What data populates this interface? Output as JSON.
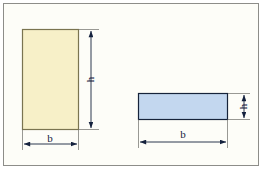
{
  "figure": {
    "background_color": "#fdfdf8",
    "frame_color": "#8d8d89",
    "annotation_color": "#14213d"
  },
  "shapes": [
    {
      "id": "tall-rectangle",
      "name": "tall-rectangle",
      "fill_color": "#f7f0c8",
      "stroke_color": "#7a7450",
      "x": 22,
      "y": 29,
      "width": 57,
      "height": 101,
      "width_label": "b",
      "height_label": "h"
    },
    {
      "id": "wide-rectangle",
      "name": "wide-rectangle",
      "fill_color": "#c3d7ef",
      "stroke_color": "#16233a",
      "x": 138,
      "y": 93,
      "width": 90,
      "height": 27,
      "width_label": "b",
      "height_label": "h"
    }
  ],
  "dimensions": {
    "tall_height": {
      "label": "h",
      "orientation": "vertical",
      "label_x": 87,
      "label_y": 79
    },
    "tall_width": {
      "label": "b",
      "orientation": "horizontal",
      "label_x": 50,
      "label_y": 140
    },
    "wide_height": {
      "label": "h",
      "orientation": "vertical",
      "label_x": 240,
      "label_y": 107
    },
    "wide_width": {
      "label": "b",
      "orientation": "horizontal",
      "label_x": 183,
      "label_y": 136
    }
  },
  "caption": {
    "text": ""
  }
}
